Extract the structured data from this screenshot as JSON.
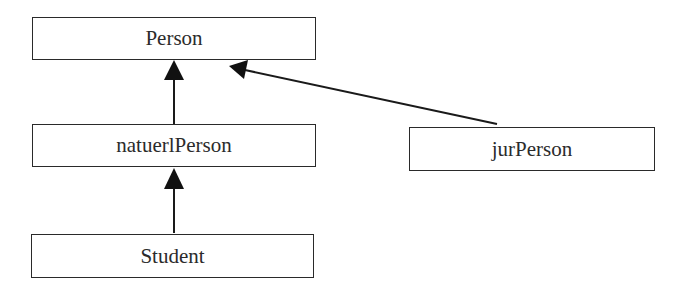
{
  "diagram": {
    "type": "inheritance",
    "nodes": [
      {
        "id": "person",
        "label": "Person"
      },
      {
        "id": "natuerlPerson",
        "label": "natuerlPerson"
      },
      {
        "id": "jurPerson",
        "label": "jurPerson"
      },
      {
        "id": "student",
        "label": "Student"
      }
    ],
    "edges": [
      {
        "from": "natuerlPerson",
        "to": "person"
      },
      {
        "from": "jurPerson",
        "to": "person"
      },
      {
        "from": "student",
        "to": "natuerlPerson"
      }
    ]
  }
}
